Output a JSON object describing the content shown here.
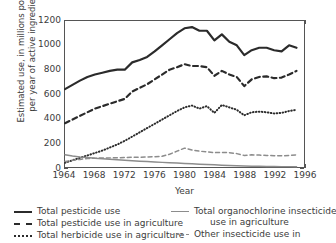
{
  "chart_data": {
    "type": "line",
    "title": "",
    "xlabel": "Year",
    "ylabel_line1": "Estimated use, in millions pounds",
    "ylabel_line2": "per year of active ingredient",
    "xlim": [
      1964,
      1996
    ],
    "ylim": [
      0,
      1200
    ],
    "xticks": [
      1964,
      1968,
      1972,
      1976,
      1980,
      1984,
      1988,
      1992,
      1996
    ],
    "xticklabels": [
      "1964",
      "1968",
      "1972",
      "1976",
      "1980",
      "1984",
      "1988",
      "1992",
      "1996"
    ],
    "yticks": [
      0,
      200,
      400,
      600,
      800,
      1000,
      1200
    ],
    "yticklabels": [
      "0",
      "200",
      "400",
      "600",
      "800",
      "1000",
      "1200"
    ],
    "grid": false,
    "legend_position": "below-axes-two-columns",
    "x": [
      1964,
      1965,
      1966,
      1967,
      1968,
      1969,
      1970,
      1971,
      1972,
      1973,
      1974,
      1975,
      1976,
      1977,
      1978,
      1979,
      1980,
      1981,
      1982,
      1983,
      1984,
      1985,
      1986,
      1987,
      1988,
      1989,
      1990,
      1991,
      1992,
      1993,
      1994,
      1995
    ],
    "series": [
      {
        "name": "Total pesticide use",
        "style": "solid",
        "color": "#2b2b2b",
        "width": 2.2,
        "values": [
          640,
          675,
          710,
          740,
          760,
          775,
          790,
          800,
          800,
          860,
          880,
          905,
          950,
          1000,
          1050,
          1100,
          1140,
          1150,
          1120,
          1120,
          1040,
          1090,
          1030,
          1000,
          920,
          960,
          980,
          980,
          960,
          950,
          1000,
          980
        ]
      },
      {
        "name": "Total pesticide use in agriculture",
        "style": "dashed",
        "color": "#2b2b2b",
        "width": 2.2,
        "values": [
          360,
          390,
          420,
          450,
          480,
          500,
          520,
          540,
          560,
          620,
          650,
          680,
          720,
          760,
          800,
          820,
          845,
          830,
          830,
          820,
          750,
          790,
          760,
          740,
          665,
          720,
          740,
          745,
          730,
          735,
          760,
          790
        ]
      },
      {
        "name": "Total herbicide use in agriculture",
        "style": "dotted",
        "color": "#2b2b2b",
        "width": 2.0,
        "values": [
          35,
          55,
          75,
          95,
          115,
          135,
          160,
          185,
          215,
          250,
          285,
          320,
          355,
          390,
          425,
          460,
          490,
          505,
          480,
          500,
          445,
          510,
          490,
          470,
          425,
          450,
          455,
          450,
          440,
          445,
          460,
          470
        ]
      },
      {
        "name": "Total organochlorine insecticide use in agriculture",
        "style": "solid",
        "color": "#8c8c8c",
        "width": 1.5,
        "values": [
          100,
          90,
          82,
          78,
          72,
          68,
          64,
          60,
          56,
          52,
          48,
          45,
          41,
          38,
          35,
          32,
          29,
          26,
          23,
          20,
          18,
          15,
          13,
          11,
          9,
          7,
          6,
          5,
          4,
          3,
          3,
          2
        ]
      },
      {
        "name": "Other insecticide use in",
        "style": "dashed",
        "color": "#8c8c8c",
        "width": 1.5,
        "values": [
          45,
          55,
          62,
          70,
          72,
          74,
          75,
          76,
          78,
          80,
          80,
          82,
          85,
          88,
          105,
          130,
          155,
          140,
          130,
          125,
          118,
          120,
          118,
          110,
          95,
          100,
          98,
          95,
          93,
          92,
          95,
          100
        ]
      }
    ]
  },
  "legend": {
    "left_column": [
      {
        "label": "Total pesticide use",
        "swatch": "solid-black-line-icon"
      },
      {
        "label": "Total pesticide use in agriculture",
        "swatch": "dashed-black-line-icon"
      },
      {
        "label": "Total herbicide use in agriculture",
        "swatch": "dotted-black-line-icon"
      }
    ],
    "right_column": [
      {
        "label": "Total organochlorine insecticide",
        "label2": "use in agriculture",
        "swatch": "solid-gray-line-icon"
      },
      {
        "label": "Other insecticide use in",
        "label2": "",
        "swatch": "dashed-gray-line-icon"
      }
    ]
  }
}
